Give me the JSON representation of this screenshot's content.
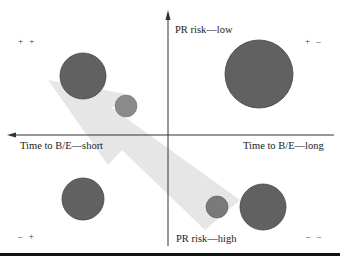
{
  "diagram": {
    "axes": {
      "y_top_label": "PR risk—low",
      "y_bottom_label": "PR risk—high",
      "x_left_label": "Time to B/E—short",
      "x_right_label": "Time to B/E—long"
    },
    "quadrants": {
      "top_left": "+ +",
      "top_right": "+ –",
      "bottom_left": "– +",
      "bottom_right": "– –"
    },
    "colors": {
      "circle_dark": "#616161",
      "circle_medium": "#8a8a8a",
      "arrow_fill": "#e6e6e6",
      "axis": "#333333"
    },
    "bubbles": [
      {
        "quadrant": "top-left",
        "cx": 83,
        "cy": 76,
        "r": 23,
        "shade": "dark"
      },
      {
        "quadrant": "top-right",
        "cx": 259,
        "cy": 74,
        "r": 34,
        "shade": "dark"
      },
      {
        "quadrant": "top-left",
        "cx": 126,
        "cy": 106,
        "r": 11,
        "shade": "medium"
      },
      {
        "quadrant": "bottom-left",
        "cx": 83,
        "cy": 199,
        "r": 21,
        "shade": "dark"
      },
      {
        "quadrant": "bottom-right",
        "cx": 217,
        "cy": 207,
        "r": 11,
        "shade": "medium"
      },
      {
        "quadrant": "bottom-right",
        "cx": 263,
        "cy": 207,
        "r": 23,
        "shade": "dark"
      }
    ],
    "arrow": {
      "direction": "bottom-right to top-left",
      "from": [
        225,
        215
      ],
      "to": [
        50,
        80
      ]
    }
  }
}
